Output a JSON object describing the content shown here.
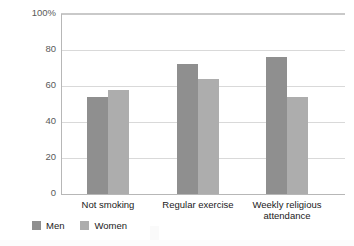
{
  "chart_data": {
    "type": "bar",
    "title": "",
    "subtitle": "",
    "xlabel": "",
    "ylabel": "",
    "ylim": [
      0,
      100
    ],
    "yticks": [
      "0",
      "20",
      "40",
      "60",
      "80",
      "100%"
    ],
    "ytick_values": [
      0,
      20,
      40,
      60,
      80,
      100
    ],
    "grid": true,
    "legend_position": "bottom-left",
    "categories": [
      "Not smoking",
      "Regular exercise",
      "Weekly religious attendance"
    ],
    "series": [
      {
        "name": "Men",
        "color": "#8f8f8f",
        "values": [
          54,
          72,
          76
        ]
      },
      {
        "name": "Women",
        "color": "#adadad",
        "values": [
          58,
          64,
          54
        ]
      }
    ]
  },
  "legend": {
    "items": [
      {
        "label": "Men",
        "color": "#8f8f8f"
      },
      {
        "label": "Women",
        "color": "#adadad"
      }
    ]
  },
  "watermark": {
    "center_text": "",
    "bottom_text": ""
  }
}
